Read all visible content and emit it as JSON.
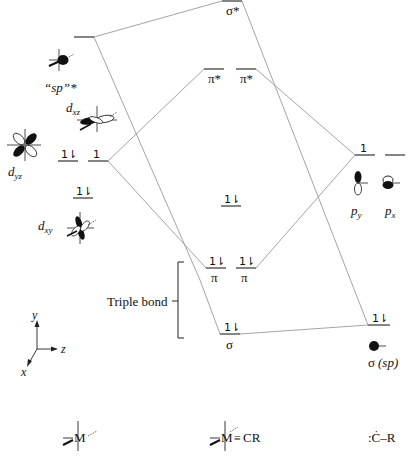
{
  "diagram": {
    "type": "molecular-orbital-diagram",
    "columns": {
      "left": {
        "label": "M fragment",
        "formula": "M"
      },
      "center": {
        "label": "complex",
        "formula": "M≡CR"
      },
      "right": {
        "label": "carbyne",
        "formula": ":Ċ–R"
      }
    },
    "left_orbitals": {
      "sp_star": {
        "label": "“sp”*",
        "electrons": ""
      },
      "dxz": {
        "label_main": "d",
        "label_sub": "xz"
      },
      "dyz": {
        "label_main": "d",
        "label_sub": "yz"
      },
      "dxy": {
        "label_main": "d",
        "label_sub": "xy"
      },
      "level_dyz_pair": {
        "electrons": "1⇂"
      },
      "level_dxz_single": {
        "electrons": "1"
      },
      "level_dxy_pair": {
        "electrons": "1⇂"
      }
    },
    "center_orbitals": {
      "sigma_star": {
        "label": "σ*",
        "electrons": ""
      },
      "pi_star_1": {
        "label": "π*",
        "electrons": ""
      },
      "pi_star_2": {
        "label": "π*",
        "electrons": ""
      },
      "nonbonding": {
        "electrons": "1⇂"
      },
      "pi_1": {
        "label": "π",
        "electrons": "1⇂"
      },
      "pi_2": {
        "label": "π",
        "electrons": "1⇂"
      },
      "sigma": {
        "label": "σ",
        "electrons": "1⇂"
      }
    },
    "right_orbitals": {
      "py": {
        "label_main": "p",
        "label_sub": "y",
        "electrons": "1"
      },
      "px": {
        "label_main": "p",
        "label_sub": "x",
        "electrons": ""
      },
      "sigma_sp": {
        "label": "σ",
        "label_paren": "(sp)",
        "electrons": "1⇂"
      }
    },
    "bracket_label": "Triple bond",
    "axes": {
      "x": "x",
      "y": "y",
      "z": "z"
    },
    "bottom_labels": {
      "left_metal": "M",
      "center_metal": "M",
      "center_bond": "≡",
      "center_cr": "CR",
      "right": ":Ċ–R"
    }
  }
}
